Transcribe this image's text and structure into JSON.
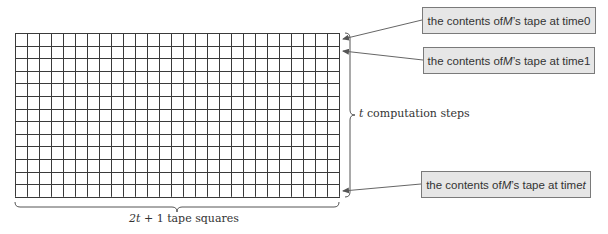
{
  "diagram": {
    "grid": {
      "columns": 27,
      "rows": 13,
      "x": 15,
      "y": 33,
      "cell_width": 12,
      "cell_height": 12.6,
      "line_color": "#3a3a3a"
    },
    "callouts": [
      {
        "prefix": "the contents of ",
        "var": "M",
        "suffix": "’s tape at time ",
        "time": "0",
        "time_italic": false
      },
      {
        "prefix": "the contents of ",
        "var": "M",
        "suffix": "’s tape at time ",
        "time": "1",
        "time_italic": false
      },
      {
        "prefix": "the contents of ",
        "var": "M",
        "suffix": "’s tape at time ",
        "time": "t",
        "time_italic": true
      }
    ],
    "side_brace_label": {
      "var": "t",
      "text": " computation steps"
    },
    "bottom_brace_label": {
      "var": "2t",
      "text": " + 1 tape squares"
    },
    "colors": {
      "callout_fill": "#e6e6e6",
      "callout_border": "#7a7a7a",
      "arrow": "#666666",
      "brace": "#555555"
    }
  }
}
